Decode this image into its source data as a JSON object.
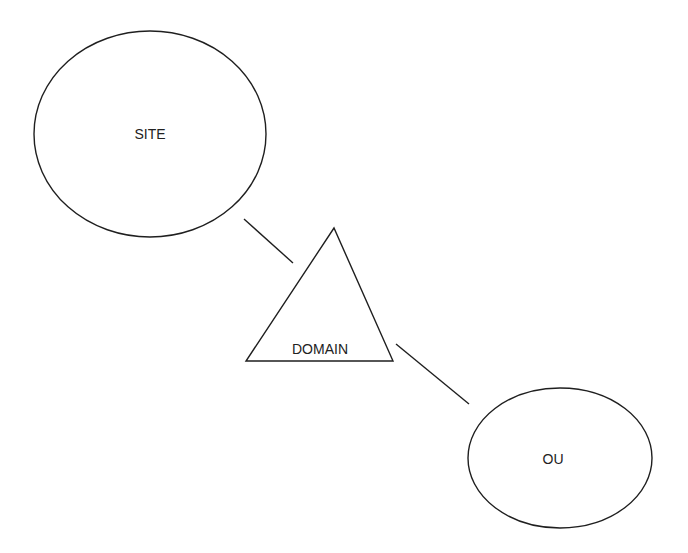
{
  "diagram": {
    "type": "hierarchy",
    "nodes": [
      {
        "id": "site",
        "label": "SITE",
        "shape": "ellipse",
        "icon": "ellipse-shape"
      },
      {
        "id": "domain",
        "label": "DOMAIN",
        "shape": "triangle",
        "icon": "triangle-shape"
      },
      {
        "id": "ou",
        "label": "OU",
        "shape": "ellipse",
        "icon": "ellipse-shape"
      }
    ],
    "edges": [
      {
        "from": "site",
        "to": "domain"
      },
      {
        "from": "domain",
        "to": "ou"
      }
    ],
    "colors": {
      "stroke": "#1f1f1f",
      "text": "#222222",
      "background": "#ffffff"
    }
  }
}
